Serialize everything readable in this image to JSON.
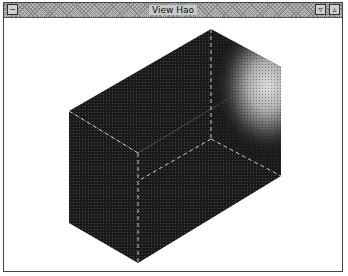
{
  "window": {
    "title": "View Hao",
    "buttons": {
      "menu": "−",
      "minimize": "▿",
      "maximize": "▵"
    }
  },
  "viewport": {
    "object": "shaded-box",
    "colors": {
      "face_dark": "#1c1c1c",
      "face_mid": "#2a2a2a",
      "highlight": "#d8d8d8",
      "edge": "#bdbdbd"
    }
  }
}
